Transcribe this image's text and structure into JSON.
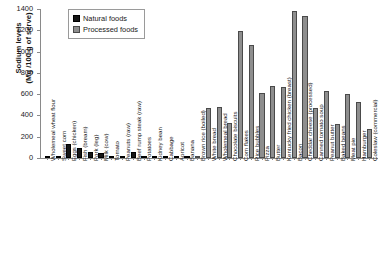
{
  "chart_data": {
    "type": "bar",
    "title": "",
    "xlabel": "",
    "ylabel": "Sodium levels (Mg /100 g of serve)",
    "ylabel_line1": "Sodium levels",
    "ylabel_line2": "(Mg /100 g of serve)",
    "ylim": [
      0,
      1400
    ],
    "yticks": [
      0,
      200,
      400,
      600,
      800,
      1000,
      1200,
      1400
    ],
    "grid": false,
    "legend_position": "top-left-inside",
    "legend": [
      {
        "name": "Natural foods",
        "color": "#161616"
      },
      {
        "name": "Processed foods",
        "color": "#8e8e8e"
      }
    ],
    "categories": [
      "Wholemeal wheat flour",
      "Sweet corn",
      "Eggs (chicken)",
      "Fish (bream)",
      "Pork (leg)",
      "Milk (cow)",
      "Tomato",
      "Peanuts (raw)",
      "Beef rump steak (raw)",
      "Potatoes",
      "Kidney bean",
      "Cabbage",
      "Apricot",
      "Banana",
      "Brown rice (boiled)",
      "White bread",
      "Wholemeal bread",
      "Chocolate biscuits",
      "Corn flakes",
      "Rice bubbles",
      "Pizza",
      "Butter",
      "Kentucky fried chicken (breast)",
      "Bacon",
      "Cheddar cheese (processed)",
      "Canned tomato soup",
      "Peanut butter",
      "Baked beans",
      "Meat pie",
      "Hamburger",
      "Coleslaw (commercial)"
    ],
    "groups": [
      "natural",
      "natural",
      "natural",
      "natural",
      "natural",
      "natural",
      "natural",
      "natural",
      "natural",
      "natural",
      "natural",
      "natural",
      "natural",
      "natural",
      "processed",
      "processed",
      "processed",
      "processed",
      "processed",
      "processed",
      "processed",
      "processed",
      "processed",
      "processed",
      "processed",
      "processed",
      "processed",
      "processed",
      "processed",
      "processed",
      "processed"
    ],
    "values": [
      3,
      5,
      130,
      90,
      60,
      45,
      8,
      6,
      55,
      7,
      10,
      12,
      4,
      3,
      6,
      470,
      480,
      330,
      1190,
      1060,
      610,
      680,
      670,
      1380,
      1330,
      470,
      630,
      320,
      600,
      530,
      270
    ]
  }
}
